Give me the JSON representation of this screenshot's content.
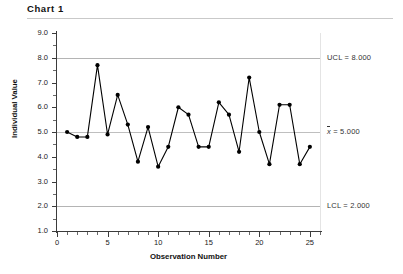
{
  "header": {
    "title": "Chart 1"
  },
  "chart_data": {
    "type": "line",
    "title": "Chart 1",
    "xlabel": "Observation Number",
    "ylabel": "Individual Value",
    "xlim": [
      0,
      26
    ],
    "ylim": [
      1.0,
      9.0
    ],
    "grid": false,
    "legend": null,
    "x": [
      1,
      2,
      3,
      4,
      5,
      6,
      7,
      8,
      9,
      10,
      11,
      12,
      13,
      14,
      15,
      16,
      17,
      18,
      19,
      20,
      21,
      22,
      23,
      24,
      25
    ],
    "values": [
      5.0,
      4.8,
      4.8,
      7.7,
      4.9,
      6.5,
      5.3,
      3.8,
      5.2,
      3.6,
      4.4,
      6.0,
      5.7,
      4.4,
      4.4,
      6.2,
      5.7,
      4.2,
      7.2,
      5.0,
      3.7,
      6.1,
      6.1,
      3.7,
      4.4
    ],
    "xticks": [
      0,
      5,
      10,
      15,
      20,
      25
    ],
    "xtick_labels": [
      "0",
      "5",
      "10",
      "15",
      "20",
      "25"
    ],
    "yticks": [
      1.0,
      2.0,
      3.0,
      4.0,
      5.0,
      6.0,
      7.0,
      8.0,
      9.0
    ],
    "ytick_labels": [
      "1.0",
      "2.0",
      "3.0",
      "4.0",
      "5.0",
      "6.0",
      "7.0",
      "8.0",
      "9.0"
    ],
    "reference_lines": [
      {
        "name": "UCL",
        "value": 8.0,
        "label": "UCL = 8.000"
      },
      {
        "name": "CL",
        "value": 5.0,
        "label_prefix": "x",
        "label_suffix": " = 5.000"
      },
      {
        "name": "LCL",
        "value": 2.0,
        "label": "LCL = 2.000"
      }
    ],
    "series_color": "#000000",
    "marker": "filled-circle"
  }
}
